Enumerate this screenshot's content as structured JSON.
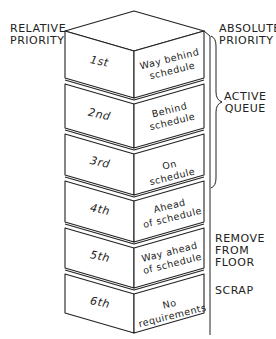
{
  "labels": {
    "relative_priority": [
      "RELATIVE",
      "PRIORITY"
    ],
    "absolute_priority": [
      "ABSOLUTE",
      "PRIORITY"
    ],
    "active_queue": [
      "ACTIVE",
      "QUEUE"
    ],
    "remove_from_floor": [
      "REMOVE",
      "FROM FLOOR"
    ],
    "scrap": "SCRAP"
  },
  "blocks": [
    {
      "rank": "1st",
      "status": [
        "Way behind",
        "schedule"
      ]
    },
    {
      "rank": "2nd",
      "status": [
        "Behind",
        "schedule"
      ]
    },
    {
      "rank": "3rd",
      "status": [
        "On schedule"
      ]
    },
    {
      "rank": "4th",
      "status": [
        "Ahead",
        "of schedule"
      ]
    },
    {
      "rank": "5th",
      "status": [
        "Way ahead",
        "of schedule"
      ]
    },
    {
      "rank": "6th",
      "status": [
        "No requirements"
      ]
    }
  ]
}
